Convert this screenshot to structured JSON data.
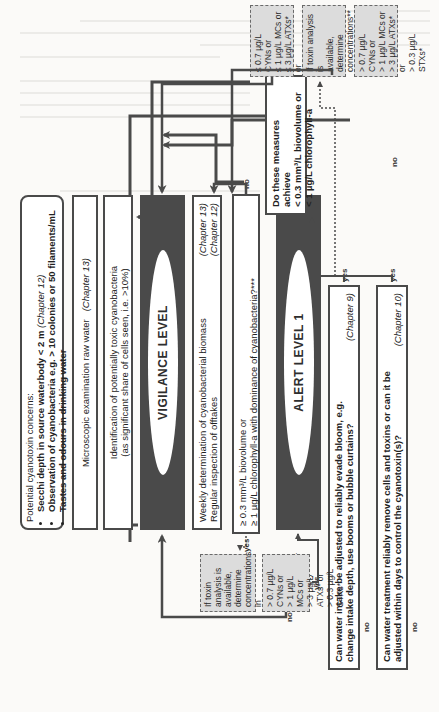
{
  "concerns": {
    "title": "Potential cyanotoxin concerns:",
    "items": [
      {
        "text": "Secchi depth in source waterbody < 2 m",
        "chapter": "(Chapter 12)"
      },
      {
        "text": "Observation of cyanobacteria e.g. > 10 colonies or 50 filaments/mL",
        "chapter": ""
      },
      {
        "text": "Tastes and odours in drinking water",
        "chapter": ""
      }
    ]
  },
  "microscopic": {
    "text": "Microscopic examination raw water",
    "chapter": "(Chapter 13)"
  },
  "identification": {
    "line1": "Identification of potentially toxic cyanobacteria",
    "line2": "(as significant share of cells seen, i.e. >10%)"
  },
  "vigilance": {
    "label": "VIGILANCE LEVEL"
  },
  "weekly": {
    "line1": "Weekly determination of cyanobacterial biomass",
    "chapter1": "(Chapter 13)",
    "line2": "Regular inspection of offtakes",
    "chapter2": "(Chapter 12)"
  },
  "threshold_question": {
    "line1": "≥ 0.3 mm³/L biovolume or",
    "line2": "≥ 1 µg/L chlorophyll-a with dominance of cyanobacteria?***"
  },
  "alert1": {
    "label": "ALERT LEVEL 1"
  },
  "intake_question": {
    "line1": "Can water intake be adjusted to reliably evade bloom, e.g.",
    "line2": "change intake depth, use booms or bubble curtains?",
    "chapter": "(Chapter 9)"
  },
  "treatment_question": {
    "line1": "Can water treatment reliably remove cells and toxins or can it be",
    "line2": "adjusted within days to control the cyanotoxin(s)?",
    "chapter": "(Chapter 10)"
  },
  "measures_question": {
    "line1": "Do these measures achieve",
    "line2": "< 0.3 mm³/L biovolume or",
    "line3": "< 1 µg/L chlorophyll-a"
  },
  "toxin_analysis_raw": {
    "line1": "If toxin analysis is",
    "line2": "available, determine",
    "line3": "concentrations in",
    "line4": "raw waterbody /raw",
    "line5": "water",
    "chapter": "(Chapter 14)"
  },
  "toxin_above_raw": {
    "lines": [
      "> 0.7 µg/L CYNs or",
      "> 1 µg/L MCs or",
      "> 3 µg/L ATXs* or",
      "> 0.3 µg/L STXs*"
    ]
  },
  "toxin_analysis_treated": {
    "line1": "If toxin analysis is",
    "line2": "available,",
    "line3": "determine",
    "line4": "concentrations**",
    "chapter": "(Chapter 14)"
  },
  "toxin_below_treated": {
    "lines": [
      "≤ 0.7 µg/L CYNs or",
      "≤ 1 µg/L MCs or",
      "≤ 3 µg/L ATXs* or",
      "≤ 0.3 µg/L STXs*"
    ]
  },
  "toxin_above_treated": {
    "lines": [
      "> 0.7 µg/L CYNs or",
      "> 1 µg/L MCs or",
      "> 3 µg/L ATXs* or",
      "> 0.3 µg/L STXs*"
    ]
  },
  "labels": {
    "yes": "yes",
    "no": "no"
  }
}
